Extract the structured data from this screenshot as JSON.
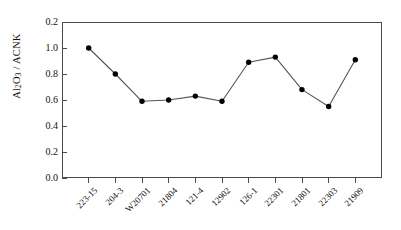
{
  "chart_data": {
    "type": "line",
    "title": "",
    "xlabel": "",
    "ylabel": "Al2O3 / ACNK",
    "ylabel_parts": {
      "pre": "Al",
      "sub1": "2",
      "mid": "O",
      "sub2": "3",
      "post": " / ACNK"
    },
    "categories": [
      "223-15",
      "204-3",
      "W20701",
      "21804",
      "121-4",
      "12902",
      "126-1",
      "22301",
      "21801",
      "22303",
      "21909"
    ],
    "values": [
      1.0,
      0.8,
      0.59,
      0.6,
      0.63,
      0.59,
      0.89,
      0.93,
      0.68,
      0.55,
      0.91
    ],
    "ylim": [
      0.0,
      1.2
    ],
    "yticks": [
      "0.0",
      "0.2",
      "0.4",
      "0.6",
      "0.8",
      "1.0",
      "0.2"
    ],
    "ytick_values": [
      0.0,
      0.2,
      0.4,
      0.6,
      0.8,
      1.0,
      1.2
    ],
    "grid": false,
    "legend": "none",
    "marker": "filled-circle",
    "marker_color": "#000000",
    "line_color": "#555555",
    "axis_color": "#4a4a4a"
  }
}
